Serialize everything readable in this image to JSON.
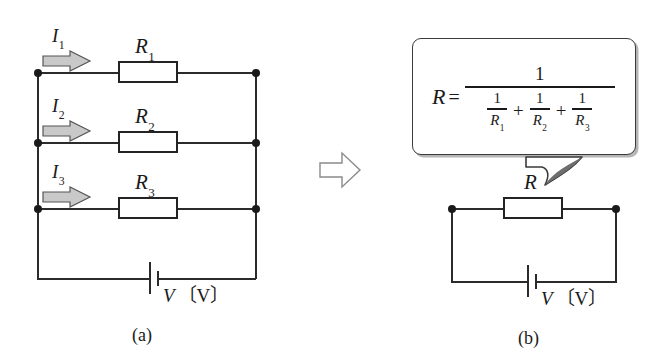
{
  "figure": {
    "type": "circuit-diagram",
    "panel_a": {
      "caption": "(a)",
      "branches": [
        {
          "current_label": "I",
          "current_sub": "1",
          "resistor_label": "R",
          "resistor_sub": "1"
        },
        {
          "current_label": "I",
          "current_sub": "2",
          "resistor_label": "R",
          "resistor_sub": "2"
        },
        {
          "current_label": "I",
          "current_sub": "3",
          "resistor_label": "R",
          "resistor_sub": "3"
        }
      ],
      "source_label": "V",
      "source_unit": "〔V〕"
    },
    "transition_arrow": "right-arrow",
    "panel_b": {
      "caption": "(b)",
      "resistor_label": "R",
      "source_label": "V",
      "source_unit": "〔V〕",
      "formula": {
        "lhs": "R",
        "equals": "=",
        "numerator": "1",
        "denominator_terms": [
          {
            "num": "1",
            "den": "R",
            "den_sub": "1"
          },
          {
            "num": "1",
            "den": "R",
            "den_sub": "2"
          },
          {
            "num": "1",
            "den": "R",
            "den_sub": "3"
          }
        ],
        "operator": "+"
      }
    }
  },
  "colors": {
    "wire": "#2b2b2b",
    "node": "#1a1a1a",
    "resistor_fill": "#ffffff",
    "resistor_border": "#232323",
    "current_arrow_fill": "#c9c9c9",
    "current_arrow_stroke": "#555555",
    "transition_arrow_fill": "#ffffff",
    "transition_arrow_stroke": "#8a8a8a",
    "bubble_border": "#3a3a3a",
    "text": "#1a1a1a"
  }
}
